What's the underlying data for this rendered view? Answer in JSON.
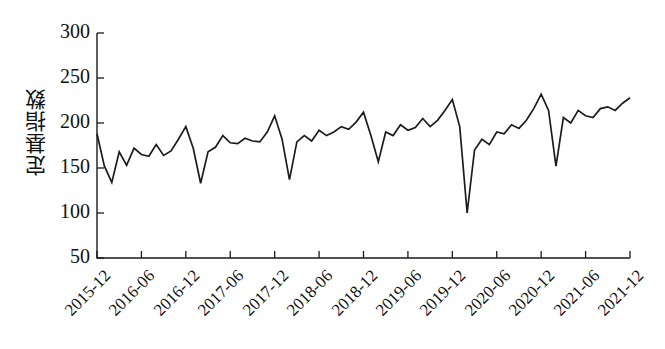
{
  "chart_data": {
    "type": "line",
    "title": "",
    "xlabel": "",
    "ylabel": "定基指数",
    "ylim": [
      50,
      300
    ],
    "yticks": [
      50,
      100,
      150,
      200,
      250,
      300
    ],
    "grid": false,
    "legend": "none",
    "line_color": "#1c1c1c",
    "xtick_labels": [
      "2015-12",
      "2016-06",
      "2016-12",
      "2017-06",
      "2017-12",
      "2018-06",
      "2018-12",
      "2019-06",
      "2019-12",
      "2020-06",
      "2020-12",
      "2021-06",
      "2021-12"
    ],
    "x": [
      "2015-12",
      "2016-01",
      "2016-02",
      "2016-03",
      "2016-04",
      "2016-05",
      "2016-06",
      "2016-07",
      "2016-08",
      "2016-09",
      "2016-10",
      "2016-11",
      "2016-12",
      "2017-01",
      "2017-02",
      "2017-03",
      "2017-04",
      "2017-05",
      "2017-06",
      "2017-07",
      "2017-08",
      "2017-09",
      "2017-10",
      "2017-11",
      "2017-12",
      "2018-01",
      "2018-02",
      "2018-03",
      "2018-04",
      "2018-05",
      "2018-06",
      "2018-07",
      "2018-08",
      "2018-09",
      "2018-10",
      "2018-11",
      "2018-12",
      "2019-01",
      "2019-02",
      "2019-03",
      "2019-04",
      "2019-05",
      "2019-06",
      "2019-07",
      "2019-08",
      "2019-09",
      "2019-10",
      "2019-11",
      "2019-12",
      "2020-01",
      "2020-02",
      "2020-03",
      "2020-04",
      "2020-05",
      "2020-06",
      "2020-07",
      "2020-08",
      "2020-09",
      "2020-10",
      "2020-11",
      "2020-12",
      "2021-01",
      "2021-02",
      "2021-03",
      "2021-04",
      "2021-05",
      "2021-06",
      "2021-07",
      "2021-08",
      "2021-09",
      "2021-10",
      "2021-11",
      "2021-12"
    ],
    "values": [
      188,
      152,
      134,
      168,
      153,
      172,
      165,
      163,
      176,
      164,
      169,
      182,
      196,
      172,
      133,
      168,
      173,
      186,
      178,
      177,
      183,
      180,
      179,
      190,
      208,
      182,
      137,
      179,
      186,
      180,
      192,
      186,
      190,
      196,
      193,
      201,
      212,
      186,
      157,
      190,
      186,
      198,
      192,
      195,
      205,
      196,
      203,
      214,
      226,
      196,
      100,
      170,
      182,
      176,
      190,
      188,
      198,
      194,
      203,
      216,
      232,
      214,
      152,
      206,
      200,
      214,
      208,
      206,
      216,
      218,
      214,
      222,
      228
    ]
  }
}
